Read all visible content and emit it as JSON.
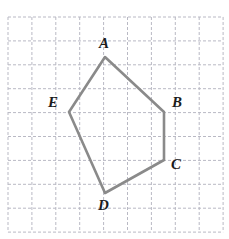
{
  "figure": {
    "name": "pentagon-on-grid",
    "background_color": "#ffffff",
    "grid": {
      "columns": 9,
      "rows": 9,
      "origin_x": 8,
      "origin_y": 17,
      "cell_size": 23.9,
      "line_color": "#b9b9c4",
      "line_width": 1,
      "dash_pattern": "3 2"
    },
    "shape": {
      "type": "pentagon",
      "stroke_color": "#8a8a8a",
      "stroke_width": 2.6,
      "fill": "none",
      "points": "105,57 164,112 164,160 105,193 69,112",
      "vertices": [
        {
          "id": "A",
          "label": "A",
          "x": 105,
          "y": 57,
          "label_x": 99,
          "label_y": 36
        },
        {
          "id": "B",
          "label": "B",
          "x": 164,
          "y": 112,
          "label_x": 172,
          "label_y": 95
        },
        {
          "id": "C",
          "label": "C",
          "x": 164,
          "y": 160,
          "label_x": 171,
          "label_y": 157
        },
        {
          "id": "D",
          "label": "D",
          "x": 105,
          "y": 193,
          "label_x": 98,
          "label_y": 198
        },
        {
          "id": "E",
          "label": "E",
          "x": 69,
          "y": 112,
          "label_x": 48,
          "label_y": 95
        }
      ]
    }
  }
}
